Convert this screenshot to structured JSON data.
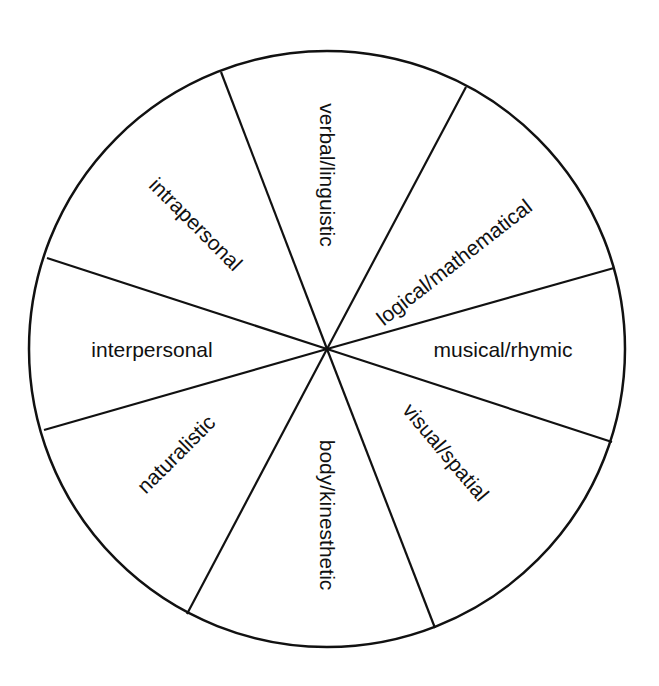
{
  "diagram": {
    "type": "segmented-wheel",
    "center": {
      "x": 327,
      "y": 349
    },
    "radius": 298,
    "stroke_color": "#111111",
    "background": "#ffffff",
    "spokes": [
      {
        "x": 221,
        "y": 72
      },
      {
        "x": 466,
        "y": 87
      },
      {
        "x": 614,
        "y": 268
      },
      {
        "x": 612,
        "y": 442
      },
      {
        "x": 435,
        "y": 628
      },
      {
        "x": 187,
        "y": 614
      },
      {
        "x": 44,
        "y": 430
      },
      {
        "x": 47,
        "y": 258
      }
    ],
    "segments": [
      {
        "id": "verbal",
        "label": "verbal/linguistic",
        "x": 327,
        "y": 175,
        "rotate": 90
      },
      {
        "id": "logical",
        "label": "logical/mathematical",
        "x": 454,
        "y": 262,
        "rotate": -38
      },
      {
        "id": "musical",
        "label": "musical/rhymic",
        "x": 503,
        "y": 349,
        "rotate": 0
      },
      {
        "id": "visual",
        "label": "visual/spatial",
        "x": 446,
        "y": 452,
        "rotate": 50
      },
      {
        "id": "body",
        "label": "body/kinesthetic",
        "x": 327,
        "y": 515,
        "rotate": 90
      },
      {
        "id": "naturalistic",
        "label": "naturalistic",
        "x": 176,
        "y": 454,
        "rotate": -45
      },
      {
        "id": "interpersonal",
        "label": "interpersonal",
        "x": 152,
        "y": 349,
        "rotate": 0
      },
      {
        "id": "intrapersonal",
        "label": "intrapersonal",
        "x": 196,
        "y": 224,
        "rotate": 45
      }
    ]
  }
}
